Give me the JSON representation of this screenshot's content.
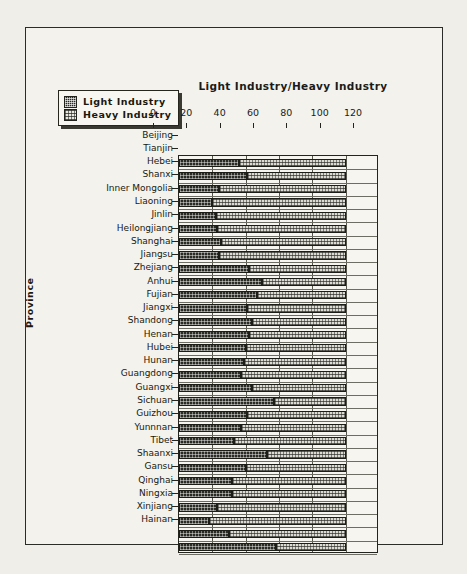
{
  "chart_data": {
    "type": "bar",
    "orientation": "horizontal",
    "stacked": true,
    "title": "Light Industry/Heavy Industry",
    "xlabel": "",
    "ylabel": "Province",
    "xlim": [
      0,
      120
    ],
    "xticks": [
      0,
      20,
      40,
      60,
      80,
      100,
      120
    ],
    "grid": true,
    "legend_position": "top-left",
    "categories": [
      "Beijing",
      "Tianjin",
      "Hebei",
      "Shanxi",
      "Inner  Mongolia",
      "Liaoning",
      "Jinlin",
      "Heilongjiang",
      "Shanghai",
      "Jiangsu",
      "Zhejiang",
      "Anhui",
      "Fujian",
      "Jiangxi",
      "Shandong",
      "Henan",
      "Hubei",
      "Hunan",
      "Guangdong",
      "Guangxi",
      "Sichuan",
      "Guizhou",
      "Yunnnan",
      "Tibet",
      "Shaanxi",
      "Gansu",
      "Qinghai",
      "Ningxia",
      "Xinjiang",
      "Hainan"
    ],
    "series": [
      {
        "name": "Light Industry",
        "values": [
          36,
          41,
          24,
          20,
          22,
          23,
          25,
          24,
          42,
          50,
          47,
          41,
          44,
          42,
          40,
          39,
          37,
          44,
          57,
          41,
          37,
          33,
          53,
          40,
          32,
          32,
          23,
          18,
          30,
          58
        ]
      },
      {
        "name": "Heavy Industry",
        "values": [
          64,
          59,
          76,
          80,
          78,
          77,
          75,
          76,
          58,
          50,
          53,
          59,
          56,
          58,
          60,
          61,
          63,
          56,
          43,
          59,
          63,
          67,
          47,
          60,
          68,
          68,
          77,
          82,
          70,
          42
        ]
      }
    ]
  },
  "legend": {
    "items": [
      {
        "label": "Light Industry",
        "swatch": "dark-checkered"
      },
      {
        "label": "Heavy Industry",
        "swatch": "light-dotted"
      }
    ]
  }
}
